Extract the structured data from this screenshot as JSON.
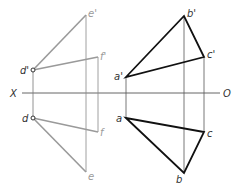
{
  "diagram": {
    "axis": {
      "left_label": "X",
      "right_label": "O",
      "y": 93,
      "x1": 22,
      "x2": 220
    },
    "colors": {
      "gray_line": "#9a9a9a",
      "black_line": "#111111",
      "thin_line": "#666666"
    },
    "left_figure": {
      "points": {
        "d_prime": {
          "label": "d'",
          "x": 33,
          "y": 70
        },
        "e_prime": {
          "label": "e'",
          "x": 86,
          "y": 15
        },
        "f_prime": {
          "label": "f'",
          "x": 98,
          "y": 57
        },
        "d": {
          "label": "d",
          "x": 33,
          "y": 118
        },
        "e": {
          "label": "e",
          "x": 86,
          "y": 172
        },
        "f": {
          "label": "f",
          "x": 98,
          "y": 132
        }
      }
    },
    "right_figure": {
      "points": {
        "a_prime": {
          "label": "a'",
          "x": 126,
          "y": 77
        },
        "b_prime": {
          "label": "b'",
          "x": 184,
          "y": 16
        },
        "c_prime": {
          "label": "c'",
          "x": 204,
          "y": 57
        },
        "a": {
          "label": "a",
          "x": 126,
          "y": 118
        },
        "b": {
          "label": "b",
          "x": 184,
          "y": 173
        },
        "c": {
          "label": "c",
          "x": 204,
          "y": 132
        }
      }
    }
  }
}
